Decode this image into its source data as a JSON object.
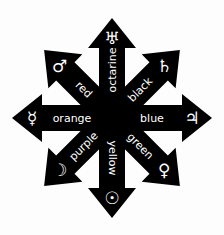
{
  "colors": {
    "background": "#fdfdfd",
    "arrow": "#000000",
    "text": "#ffffff"
  },
  "arms": [
    {
      "direction": "up",
      "angle": 0,
      "label": "octarine",
      "symbol": "♅",
      "symbol_name": "uranus-icon"
    },
    {
      "direction": "up-right",
      "angle": 45,
      "label": "black",
      "symbol": "♄",
      "symbol_name": "saturn-icon"
    },
    {
      "direction": "right",
      "angle": 90,
      "label": "blue",
      "symbol": "♃",
      "symbol_name": "jupiter-icon"
    },
    {
      "direction": "down-right",
      "angle": 135,
      "label": "green",
      "symbol": "♀",
      "symbol_name": "venus-icon"
    },
    {
      "direction": "down",
      "angle": 180,
      "label": "yellow",
      "symbol": "☉",
      "symbol_name": "sun-icon"
    },
    {
      "direction": "down-left",
      "angle": 225,
      "label": "purple",
      "symbol": "☽",
      "symbol_name": "moon-icon"
    },
    {
      "direction": "left",
      "angle": 270,
      "label": "orange",
      "symbol": "☿",
      "symbol_name": "mercury-icon"
    },
    {
      "direction": "up-left",
      "angle": 315,
      "label": "red",
      "symbol": "♂",
      "symbol_name": "mars-icon"
    }
  ]
}
